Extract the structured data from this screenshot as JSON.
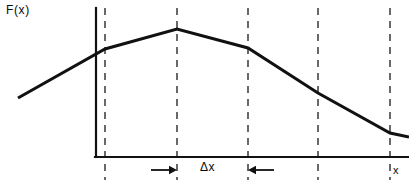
{
  "figure": {
    "width": 409,
    "height": 184,
    "background": "#ffffff",
    "ink_color": "#111111"
  },
  "labels": {
    "y_axis": "F(x)",
    "x_axis": "x",
    "interval": "Δx"
  },
  "chart_data": {
    "type": "line",
    "title": "",
    "xlabel": "x",
    "ylabel": "F(x)",
    "grid": false,
    "legend": null,
    "annotations": [
      {
        "text": "Δx",
        "kind": "interval-measure",
        "from_gridline": 2,
        "to_gridline": 3,
        "arrows": "inward-pointing pair flanking the label"
      }
    ],
    "axes": {
      "y_axis_x_px": 96,
      "x_axis_y_px": 157,
      "x_axis_extends_to_px": 409,
      "y_axis_top_px": 8,
      "origin_px": [
        96,
        157
      ]
    },
    "gridlines": {
      "style": "dashed vertical",
      "count": 5,
      "x_px": [
        105,
        177,
        248,
        318,
        390
      ],
      "top_px": 8,
      "bottom_px": 180
    },
    "curve": {
      "description": "piecewise-linear curve rising to a peak at the third gridline then falling",
      "points_px": [
        [
          18,
          98
        ],
        [
          105,
          49
        ],
        [
          177,
          29
        ],
        [
          248,
          48
        ],
        [
          318,
          93
        ],
        [
          390,
          133
        ],
        [
          409,
          137
        ]
      ],
      "vertices_on_gridlines": [
        1,
        2,
        3,
        4,
        5
      ]
    },
    "x": [
      0,
      1,
      2,
      3,
      4,
      5,
      6
    ],
    "values": [
      0.46,
      0.84,
      1.0,
      0.85,
      0.5,
      0.19,
      0.16
    ],
    "xlim": [
      0,
      6
    ],
    "ylim": [
      0,
      1.15
    ]
  }
}
